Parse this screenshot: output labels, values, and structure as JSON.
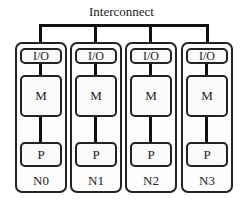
{
  "title": "Interconnect",
  "nodes": [
    {
      "label": "N0",
      "io": "I/O",
      "memory": "M",
      "processor": "P"
    },
    {
      "label": "N1",
      "io": "I/O",
      "memory": "M",
      "processor": "P"
    },
    {
      "label": "N2",
      "io": "I/O",
      "memory": "M",
      "processor": "P"
    },
    {
      "label": "N3",
      "io": "I/O",
      "memory": "M",
      "processor": "P"
    }
  ]
}
